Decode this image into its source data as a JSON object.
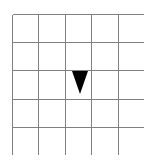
{
  "figure": {
    "background_color": "#ffffff",
    "caption": ""
  },
  "grid": {
    "rows": 5,
    "columns": 5,
    "line_color": "#808080",
    "line_width": 1,
    "cell_fill": "#ffffff",
    "origin_x": 12,
    "origin_y": 14,
    "width": 132,
    "height": 141,
    "cell_width": 26.4,
    "cell_height": 28.2,
    "row_labels": [
      "1",
      "2",
      "3",
      "4",
      "5"
    ],
    "column_labels": [
      "1",
      "2",
      "3",
      "4",
      "5"
    ]
  },
  "shapes": [
    {
      "name": "triangle",
      "kind": "triangle-down",
      "fill_color": "#000000",
      "row": 3,
      "column": 3,
      "center_x": 80,
      "top_y": 71,
      "bottom_y": 94,
      "half_width": 8,
      "points": "72,71 88,71 80,94"
    }
  ],
  "legend": {
    "visible": false,
    "entries": []
  }
}
